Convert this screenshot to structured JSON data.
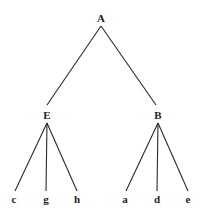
{
  "diagram": {
    "type": "tree",
    "root": {
      "label": "A",
      "children": [
        {
          "label": "E",
          "children": [
            {
              "label": "c"
            },
            {
              "label": "g"
            },
            {
              "label": "h"
            }
          ]
        },
        {
          "label": "B",
          "children": [
            {
              "label": "a"
            },
            {
              "label": "d"
            },
            {
              "label": "e"
            }
          ]
        }
      ]
    },
    "nodes": {
      "A": "A",
      "E": "E",
      "B": "B",
      "c": "c",
      "g": "g",
      "h": "h",
      "a": "a",
      "d": "d",
      "e": "e"
    },
    "edges": [
      [
        "A",
        "E"
      ],
      [
        "A",
        "B"
      ],
      [
        "E",
        "c"
      ],
      [
        "E",
        "g"
      ],
      [
        "E",
        "h"
      ],
      [
        "B",
        "a"
      ],
      [
        "B",
        "d"
      ],
      [
        "B",
        "e"
      ]
    ],
    "colors": {
      "line": "#2a2a2a",
      "text": "#1e1e1e",
      "background": "#ffffff"
    }
  }
}
